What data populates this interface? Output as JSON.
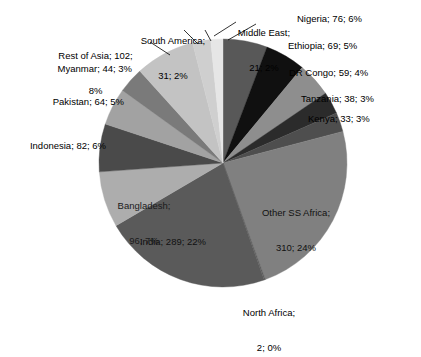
{
  "chart_data": {
    "type": "pie",
    "title": "",
    "total": 1296,
    "units": "millions",
    "label_format": "{name}; {value}; {percent}%",
    "legend": "none",
    "labels_position": "outside-and-inside",
    "start_angle_deg": 0,
    "direction": "clockwise",
    "categories": [
      "Nigeria",
      "Ethiopia",
      "DR Congo",
      "Tanzania",
      "Kenya",
      "Other SS Africa",
      "North Africa",
      "India",
      "Bangladesh",
      "Indonesia",
      "Pakistan",
      "Myanmar",
      "Rest of Asia",
      "South America",
      "Middle East"
    ],
    "values": [
      76,
      69,
      59,
      38,
      33,
      310,
      2,
      289,
      96,
      82,
      64,
      44,
      102,
      31,
      21
    ],
    "percents": [
      6,
      5,
      4,
      3,
      3,
      24,
      0,
      22,
      7,
      6,
      5,
      3,
      8,
      2,
      2
    ],
    "colors": [
      "#585858",
      "#101010",
      "#8e8e8e",
      "#2b2b2b",
      "#4e4e4e",
      "#808080",
      "#5e5e5e",
      "#5a5a5a",
      "#adadad",
      "#4a4a4a",
      "#a2a2a2",
      "#7a7a7a",
      "#c3c3c3",
      "#cfcfcf",
      "#e6e6e6"
    ],
    "slices": [
      {
        "name": "Nigeria",
        "value": 76,
        "percent": 6,
        "text": "Nigeria; 76; 6%",
        "color": "#585858",
        "label_placement": "outside"
      },
      {
        "name": "Ethiopia",
        "value": 69,
        "percent": 5,
        "text": "Ethiopia; 69; 5%",
        "color": "#101010",
        "label_placement": "outside"
      },
      {
        "name": "DR Congo",
        "value": 59,
        "percent": 4,
        "text": "DR Congo; 59; 4%",
        "color": "#8e8e8e",
        "label_placement": "outside"
      },
      {
        "name": "Tanzania",
        "value": 38,
        "percent": 3,
        "text": "Tanzania; 38; 3%",
        "color": "#2b2b2b",
        "label_placement": "outside"
      },
      {
        "name": "Kenya",
        "value": 33,
        "percent": 3,
        "text": "Kenya; 33; 3%",
        "color": "#4e4e4e",
        "label_placement": "outside"
      },
      {
        "name": "Other SS Africa",
        "value": 310,
        "percent": 24,
        "text": "Other SS Africa;\n310; 24%",
        "color": "#808080",
        "label_placement": "inside"
      },
      {
        "name": "North Africa",
        "value": 2,
        "percent": 0,
        "text": "North Africa;\n2; 0%",
        "color": "#5e5e5e",
        "label_placement": "outside"
      },
      {
        "name": "India",
        "value": 289,
        "percent": 22,
        "text": "India; 289; 22%",
        "color": "#5a5a5a",
        "label_placement": "inside"
      },
      {
        "name": "Bangladesh",
        "value": 96,
        "percent": 7,
        "text": "Bangladesh;\n96; 7%",
        "color": "#adadad",
        "label_placement": "inside"
      },
      {
        "name": "Indonesia",
        "value": 82,
        "percent": 6,
        "text": "Indonesia; 82; 6%",
        "color": "#4a4a4a",
        "label_placement": "outside"
      },
      {
        "name": "Pakistan",
        "value": 64,
        "percent": 5,
        "text": "Pakistan; 64; 5%",
        "color": "#a2a2a2",
        "label_placement": "outside"
      },
      {
        "name": "Myanmar",
        "value": 44,
        "percent": 3,
        "text": "Myanmar; 44; 3%",
        "color": "#7a7a7a",
        "label_placement": "outside"
      },
      {
        "name": "Rest of Asia",
        "value": 102,
        "percent": 8,
        "text": "Rest of Asia; 102;\n8%",
        "color": "#c3c3c3",
        "label_placement": "outside"
      },
      {
        "name": "South America",
        "value": 31,
        "percent": 2,
        "text": "South America;\n31; 2%",
        "color": "#cfcfcf",
        "label_placement": "outside-leader"
      },
      {
        "name": "Middle East",
        "value": 21,
        "percent": 2,
        "text": "Middle East;\n21; 2%",
        "color": "#e6e6e6",
        "label_placement": "outside-leader"
      }
    ],
    "geometry": {
      "center_x": 223,
      "center_y": 163,
      "radius": 124
    }
  },
  "labels": {
    "nigeria": "Nigeria; 76; 6%",
    "ethiopia": "Ethiopia; 69; 5%",
    "dr_congo": "DR Congo; 59; 4%",
    "tanzania": "Tanzania; 38; 3%",
    "kenya": "Kenya; 33; 3%",
    "other_ss_africa_line1": "Other SS Africa;",
    "other_ss_africa_line2": "310; 24%",
    "north_africa_line1": "North Africa;",
    "north_africa_line2": "2; 0%",
    "india": "India; 289; 22%",
    "bangladesh_line1": "Bangladesh;",
    "bangladesh_line2": "96; 7%",
    "indonesia": "Indonesia; 82; 6%",
    "pakistan": "Pakistan; 64; 5%",
    "myanmar": "Myanmar; 44; 3%",
    "rest_of_asia_line1": "Rest of Asia; 102;",
    "rest_of_asia_line2": "8%",
    "south_america_line1": "South America;",
    "south_america_line2": "31; 2%",
    "middle_east_line1": "Middle East;",
    "middle_east_line2": "21; 2%"
  }
}
